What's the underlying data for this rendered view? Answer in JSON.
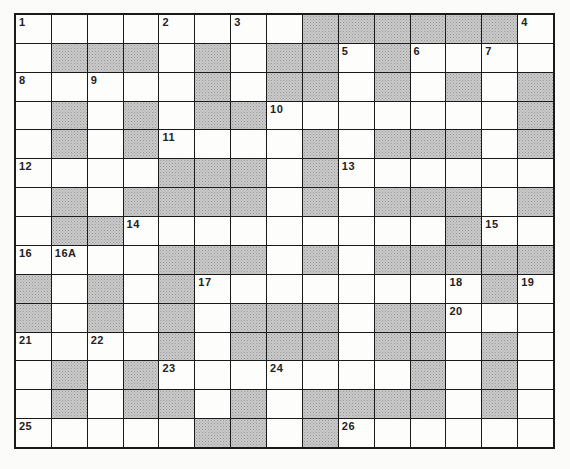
{
  "puzzle": {
    "type": "crossword",
    "rows": 15,
    "cols": 15,
    "colors": {
      "grid_line": "#1a1a1a",
      "white_cell": "#fdfdfc",
      "shaded_cell": "#c9c9c9"
    },
    "grid": [
      [
        0,
        0,
        0,
        0,
        0,
        0,
        0,
        0,
        1,
        1,
        1,
        1,
        1,
        1,
        0
      ],
      [
        0,
        1,
        1,
        1,
        0,
        1,
        0,
        1,
        1,
        0,
        1,
        0,
        0,
        0,
        0
      ],
      [
        0,
        0,
        0,
        0,
        0,
        1,
        0,
        1,
        1,
        0,
        1,
        0,
        1,
        0,
        1
      ],
      [
        0,
        1,
        0,
        1,
        0,
        1,
        1,
        0,
        0,
        0,
        0,
        0,
        0,
        0,
        1
      ],
      [
        0,
        1,
        0,
        1,
        0,
        0,
        0,
        0,
        1,
        0,
        1,
        1,
        1,
        0,
        1
      ],
      [
        0,
        0,
        0,
        0,
        1,
        1,
        1,
        0,
        1,
        0,
        0,
        0,
        0,
        0,
        0
      ],
      [
        0,
        1,
        0,
        1,
        1,
        1,
        1,
        0,
        1,
        0,
        1,
        1,
        1,
        0,
        1
      ],
      [
        0,
        1,
        1,
        0,
        0,
        0,
        0,
        0,
        0,
        0,
        0,
        0,
        1,
        0,
        0
      ],
      [
        0,
        0,
        0,
        0,
        1,
        1,
        1,
        0,
        1,
        0,
        1,
        1,
        1,
        1,
        1
      ],
      [
        1,
        0,
        1,
        0,
        1,
        0,
        0,
        0,
        0,
        0,
        0,
        0,
        0,
        1,
        0
      ],
      [
        1,
        0,
        1,
        0,
        1,
        0,
        1,
        1,
        1,
        0,
        1,
        1,
        0,
        0,
        0
      ],
      [
        0,
        0,
        0,
        0,
        1,
        0,
        1,
        1,
        1,
        0,
        1,
        1,
        0,
        1,
        0
      ],
      [
        0,
        1,
        0,
        1,
        0,
        0,
        0,
        0,
        0,
        0,
        0,
        1,
        0,
        1,
        0
      ],
      [
        0,
        1,
        0,
        1,
        1,
        0,
        1,
        0,
        1,
        1,
        1,
        1,
        0,
        1,
        0
      ],
      [
        0,
        0,
        0,
        0,
        0,
        1,
        1,
        0,
        1,
        0,
        0,
        0,
        0,
        0,
        0
      ]
    ],
    "numbers": [
      {
        "row": 0,
        "col": 0,
        "label": "1"
      },
      {
        "row": 0,
        "col": 4,
        "label": "2"
      },
      {
        "row": 0,
        "col": 6,
        "label": "3"
      },
      {
        "row": 0,
        "col": 14,
        "label": "4"
      },
      {
        "row": 1,
        "col": 9,
        "label": "5"
      },
      {
        "row": 1,
        "col": 11,
        "label": "6"
      },
      {
        "row": 1,
        "col": 13,
        "label": "7"
      },
      {
        "row": 2,
        "col": 0,
        "label": "8"
      },
      {
        "row": 2,
        "col": 2,
        "label": "9"
      },
      {
        "row": 3,
        "col": 7,
        "label": "10"
      },
      {
        "row": 4,
        "col": 4,
        "label": "11"
      },
      {
        "row": 5,
        "col": 0,
        "label": "12"
      },
      {
        "row": 5,
        "col": 9,
        "label": "13"
      },
      {
        "row": 7,
        "col": 3,
        "label": "14"
      },
      {
        "row": 7,
        "col": 13,
        "label": "15"
      },
      {
        "row": 8,
        "col": 0,
        "label": "16"
      },
      {
        "row": 8,
        "col": 1,
        "label": "16A"
      },
      {
        "row": 9,
        "col": 5,
        "label": "17"
      },
      {
        "row": 9,
        "col": 12,
        "label": "18"
      },
      {
        "row": 9,
        "col": 14,
        "label": "19"
      },
      {
        "row": 10,
        "col": 12,
        "label": "20"
      },
      {
        "row": 11,
        "col": 0,
        "label": "21"
      },
      {
        "row": 11,
        "col": 2,
        "label": "22"
      },
      {
        "row": 12,
        "col": 4,
        "label": "23"
      },
      {
        "row": 12,
        "col": 7,
        "label": "24"
      },
      {
        "row": 14,
        "col": 0,
        "label": "25"
      },
      {
        "row": 14,
        "col": 9,
        "label": "26"
      }
    ]
  }
}
